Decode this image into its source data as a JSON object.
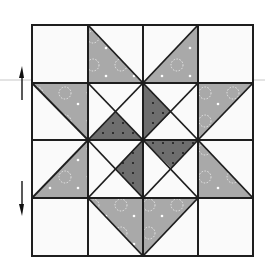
{
  "diagram": {
    "type": "quilt-block",
    "grid": {
      "rows": 4,
      "cols": 4,
      "x0": 32,
      "y0": 25,
      "x1": 253,
      "y1": 256
    },
    "colors": {
      "background": "#ffffff",
      "fabric_white": "#fafafa",
      "fabric_medium": "#a9a9a9",
      "fabric_dark": "#6e6e6e",
      "seam": "#1e1e1e",
      "guide_line": "#c8c8c8",
      "dot_light": "#ffffff",
      "dot_dark": "#1a1a1a"
    },
    "guide_line": {
      "y": 80
    },
    "arrows": [
      {
        "name": "up-arrow",
        "x": 22,
        "y_top": 67,
        "y_bottom": 100,
        "direction": "up"
      },
      {
        "name": "down-arrow",
        "x": 22,
        "y_top": 181,
        "y_bottom": 215,
        "direction": "down"
      }
    ]
  }
}
